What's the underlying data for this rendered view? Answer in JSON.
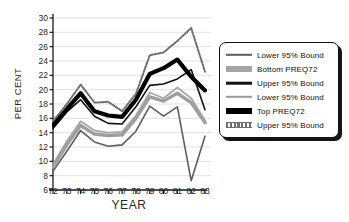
{
  "chart_data": {
    "type": "line",
    "title": "",
    "xlabel": "YEAR",
    "ylabel": "PER CENT",
    "x": [
      72,
      73,
      74,
      75,
      76,
      77,
      78,
      79,
      80,
      81,
      82,
      83
    ],
    "categories": [
      "72",
      "73",
      "74",
      "75",
      "76",
      "77",
      "78",
      "79",
      "80",
      "81",
      "82",
      "83"
    ],
    "xlim": [
      72,
      83
    ],
    "ylim": [
      6,
      30
    ],
    "ytick_labels": [
      "30",
      "28",
      "26",
      "24",
      "22",
      "20",
      "18",
      "16",
      "14",
      "12",
      "10",
      "8",
      "6"
    ],
    "yticks": [
      30,
      28,
      26,
      24,
      22,
      20,
      18,
      16,
      14,
      12,
      10,
      8,
      6
    ],
    "ytick_step": 2,
    "grid": "horizontal",
    "legend_position": "right-outside",
    "series": [
      {
        "name": "Lower 95% Bound",
        "key": "bottom_lower_95",
        "group": "Bottom PREQ72",
        "role": "lower-bound",
        "color": "#5e5e5e",
        "width": 1.6,
        "dash": "solid",
        "values": [
          8.6,
          11.4,
          14.3,
          12.7,
          12.1,
          12.3,
          14.2,
          17.7,
          16.3,
          17.6,
          7.3,
          13.5
        ]
      },
      {
        "name": "Bottom PREQ72",
        "key": "bottom_preq72",
        "group": "Bottom PREQ72",
        "role": "mean",
        "color": "#9e9e9e",
        "width": 3.4,
        "dash": "solid",
        "values": [
          9.2,
          12.3,
          15.0,
          13.8,
          13.6,
          13.7,
          16.0,
          19.0,
          18.4,
          19.5,
          18.2,
          15.4
        ]
      },
      {
        "name": "Upper 95% Bound",
        "key": "bottom_upper_95",
        "group": "Bottom PREQ72",
        "role": "upper-bound",
        "color": "#111111",
        "width": 1.6,
        "dash": "solid",
        "values": [
          14.6,
          16.9,
          18.6,
          16.3,
          15.3,
          15.2,
          17.6,
          20.6,
          20.8,
          21.5,
          22.8,
          17.2
        ]
      },
      {
        "name": "Lower 95% Bound",
        "key": "top_lower_95",
        "group": "Top PREQ72",
        "role": "lower-bound",
        "color": "#a8a8a8",
        "width": 1.8,
        "dash": "solid",
        "values": [
          9.6,
          12.8,
          15.6,
          14.3,
          14.0,
          14.1,
          16.4,
          19.6,
          18.8,
          20.3,
          18.8,
          15.7
        ]
      },
      {
        "name": "Top PREQ72",
        "key": "top_preq72",
        "group": "Top PREQ72",
        "role": "mean",
        "color": "#000000",
        "width": 4.2,
        "dash": "solid",
        "values": [
          15.0,
          17.3,
          19.5,
          17.0,
          16.4,
          16.2,
          18.6,
          22.2,
          23.0,
          24.2,
          21.8,
          19.9
        ]
      },
      {
        "name": "Upper 95% Bound",
        "key": "top_upper_95",
        "group": "Top PREQ72",
        "role": "upper-bound",
        "color": "#707070",
        "width": 2.0,
        "dash": "dotted",
        "values": [
          15.6,
          18.0,
          20.7,
          18.2,
          18.3,
          17.0,
          19.4,
          24.8,
          25.2,
          26.8,
          28.6,
          22.5
        ]
      }
    ],
    "legend_entries": [
      {
        "label": "Lower 95% Bound",
        "color": "#5e5e5e",
        "width": 2.4,
        "style": "solid"
      },
      {
        "label": "Bottom PREQ72",
        "color": "#a5a5a5",
        "width": 6.0,
        "style": "solid"
      },
      {
        "label": "Upper 95% Bound",
        "color": "#111111",
        "width": 2.6,
        "style": "solid"
      },
      {
        "label": "Lower 95% Bound",
        "color": "#9a9a9a",
        "width": 2.4,
        "style": "solid"
      },
      {
        "label": "Top PREQ72",
        "color": "#000000",
        "width": 6.0,
        "style": "solid"
      },
      {
        "label": "Upper 95% Bound",
        "color": "#6f6f6f",
        "width": 4.0,
        "style": "dotted"
      }
    ]
  }
}
